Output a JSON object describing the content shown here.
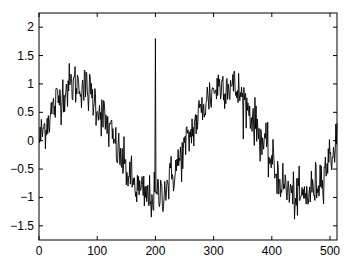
{
  "chart_data": {
    "type": "line",
    "title": "",
    "xlabel": "",
    "ylabel": "",
    "xlim": [
      0,
      512
    ],
    "ylim": [
      -1.75,
      2.25
    ],
    "xticks": [
      0,
      100,
      200,
      300,
      400,
      500
    ],
    "xtick_labels": [
      "0",
      "100",
      "200",
      "300",
      "400",
      "500"
    ],
    "yticks": [
      -1.5,
      -1,
      -0.5,
      0,
      0.5,
      1,
      1.5,
      2
    ],
    "ytick_labels": [
      "-1.5",
      "-1",
      "-0.5",
      "0",
      "0.5",
      "1",
      "1.5",
      "2"
    ],
    "grid": false,
    "legend": null,
    "series": [
      {
        "name": "noisy sine",
        "description": "sin(2*pi*n/256) plus noise (std ~0.2), n = 1..512, with a single impulse at n = 200",
        "n_points": 512,
        "amplitude": 1.0,
        "period": 256,
        "noise_std": 0.2,
        "spike": {
          "x": 200,
          "y": 1.8
        },
        "color": "#000000"
      }
    ]
  }
}
